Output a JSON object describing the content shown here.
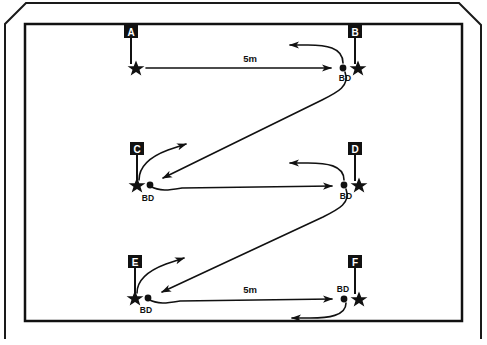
{
  "figure": {
    "colors": {
      "ink": "#111111",
      "paper": "#ffffff",
      "label_box_fill": "#111111",
      "label_box_text": "#ffffff"
    }
  },
  "frame": {
    "outer": {
      "name": "page-border",
      "corner_cut": "top-left and top-right diagonal",
      "stroke_width": 2
    },
    "inner": {
      "name": "field-border",
      "stroke_width": 2.5
    }
  },
  "stations": [
    {
      "id": "A",
      "label": "A",
      "pole_label": "A",
      "has_ball_dispenser": false,
      "bd_label": "",
      "bd_label_position": "",
      "star": {
        "x": 136,
        "y": 68
      },
      "pole": {
        "x": 131,
        "y": 38,
        "height": 26
      },
      "letter_box": {
        "x": 131,
        "y": 32
      }
    },
    {
      "id": "B",
      "label": "B",
      "pole_label": "B",
      "has_ball_dispenser": true,
      "bd_label": "BD",
      "bd_label_position": "below",
      "star": {
        "x": 357,
        "y": 68
      },
      "dot": {
        "x": 343,
        "y": 68
      },
      "pole": {
        "x": 355,
        "y": 38,
        "height": 26
      },
      "letter_box": {
        "x": 355,
        "y": 32
      }
    },
    {
      "id": "C",
      "label": "C",
      "pole_label": "C",
      "has_ball_dispenser": true,
      "bd_label": "BD",
      "bd_label_position": "below",
      "star": {
        "x": 138,
        "y": 185
      },
      "dot": {
        "x": 150,
        "y": 185
      },
      "pole": {
        "x": 137,
        "y": 155,
        "height": 26
      },
      "letter_box": {
        "x": 137,
        "y": 149
      }
    },
    {
      "id": "D",
      "label": "D",
      "pole_label": "D",
      "has_ball_dispenser": true,
      "bd_label": "BD",
      "bd_label_position": "below",
      "star": {
        "x": 357,
        "y": 185
      },
      "dot": {
        "x": 344,
        "y": 185
      },
      "pole": {
        "x": 355,
        "y": 155,
        "height": 26
      },
      "letter_box": {
        "x": 355,
        "y": 149
      }
    },
    {
      "id": "E",
      "label": "E",
      "pole_label": "E",
      "has_ball_dispenser": true,
      "bd_label": "BD",
      "bd_label_position": "below",
      "star": {
        "x": 136,
        "y": 298
      },
      "dot": {
        "x": 148,
        "y": 298
      },
      "pole": {
        "x": 135,
        "y": 268,
        "height": 26
      },
      "letter_box": {
        "x": 135,
        "y": 262
      }
    },
    {
      "id": "F",
      "label": "F",
      "pole_label": "F",
      "has_ball_dispenser": true,
      "bd_label": "BD",
      "bd_label_position": "above",
      "star": {
        "x": 357,
        "y": 298
      },
      "dot": {
        "x": 344,
        "y": 298
      },
      "pole": {
        "x": 355,
        "y": 268,
        "height": 26
      },
      "letter_box": {
        "x": 355,
        "y": 262
      }
    }
  ],
  "distance_labels": [
    {
      "text": "5m",
      "x": 250,
      "y": 60,
      "between": "A-B"
    },
    {
      "text": "5m",
      "x": 250,
      "y": 291,
      "between": "E-F"
    }
  ],
  "paths": [
    {
      "name": "run-a-to-b",
      "from": "A",
      "to": "B",
      "kind": "straight",
      "direction": "right"
    },
    {
      "name": "return-loop-b",
      "from": "B",
      "to": "B",
      "kind": "loop",
      "direction": "left"
    },
    {
      "name": "run-b-to-c",
      "from": "B",
      "to": "C",
      "kind": "diagonal",
      "direction": "down-left"
    },
    {
      "name": "return-loop-c",
      "from": "C",
      "to": "C",
      "kind": "loop",
      "direction": "up-right"
    },
    {
      "name": "run-c-to-d",
      "from": "C",
      "to": "D",
      "kind": "straight",
      "direction": "right"
    },
    {
      "name": "return-loop-d",
      "from": "D",
      "to": "D",
      "kind": "loop",
      "direction": "left"
    },
    {
      "name": "run-d-to-e",
      "from": "D",
      "to": "E",
      "kind": "diagonal",
      "direction": "down-left"
    },
    {
      "name": "return-loop-e",
      "from": "E",
      "to": "E",
      "kind": "loop",
      "direction": "up-right"
    },
    {
      "name": "run-e-to-f",
      "from": "E",
      "to": "F",
      "kind": "straight",
      "direction": "right"
    },
    {
      "name": "return-loop-f",
      "from": "F",
      "to": "F",
      "kind": "loop",
      "direction": "left"
    }
  ]
}
